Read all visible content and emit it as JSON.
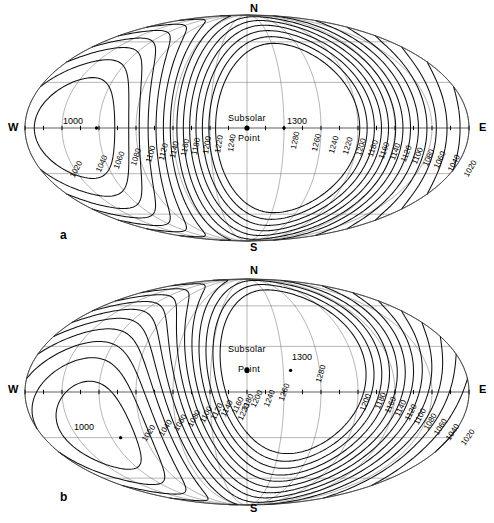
{
  "figure": {
    "kind": "two-panel global contour map",
    "projection": "Mollweide (elliptical equal-area)",
    "panels": [
      {
        "id": "a",
        "caption": "a",
        "cardinal": {
          "north": "N",
          "south": "S",
          "west": "W",
          "east": "E"
        },
        "annotations": [
          {
            "name": "subsolar-point",
            "line1": "Subsolar",
            "line2": "Point"
          },
          {
            "name": "max-value-label",
            "text": "1300"
          },
          {
            "name": "min-value-label",
            "text": "1000"
          }
        ],
        "contour_labels_left": [
          "1020",
          "1040",
          "1060",
          "1080",
          "1100",
          "1120",
          "1140",
          "1160",
          "1180",
          "1200",
          "1220",
          "1240"
        ],
        "contour_labels_right": [
          "1280",
          "1260",
          "1240",
          "1220",
          "1200",
          "1180",
          "1160",
          "1140",
          "1120",
          "1100",
          "1080",
          "1060",
          "1040",
          "1020"
        ]
      },
      {
        "id": "b",
        "caption": "b",
        "cardinal": {
          "north": "N",
          "south": "S",
          "west": "W",
          "east": "E"
        },
        "annotations": [
          {
            "name": "subsolar-point",
            "line1": "Subsolar",
            "line2": "Point"
          },
          {
            "name": "max-value-label",
            "text": "1300"
          },
          {
            "name": "min-value-label",
            "text": "1000"
          }
        ],
        "contour_labels_left": [
          "1020",
          "1040",
          "1060",
          "1080",
          "1100",
          "1120",
          "1140",
          "1160",
          "1180",
          "1200",
          "1220",
          "1240",
          "1260",
          "1280"
        ],
        "contour_labels_right": [
          "1200",
          "1180",
          "1160",
          "1140",
          "1120",
          "1100",
          "1080",
          "1060",
          "1040",
          "1020"
        ]
      }
    ]
  },
  "chart_data": {
    "type": "contour",
    "title": "",
    "xlabel": "",
    "ylabel": "",
    "projection": "Mollweide",
    "grid": true,
    "legend": "none",
    "units": "",
    "contour_interval": 20,
    "contour_levels": [
      1020,
      1040,
      1060,
      1080,
      1100,
      1120,
      1140,
      1160,
      1180,
      1200,
      1220,
      1240,
      1260,
      1280
    ],
    "value_range": [
      1000,
      1300
    ],
    "extrema": [
      {
        "label": "1300",
        "type": "maximum",
        "panel": "a",
        "lon_deg": 30,
        "lat_deg": 0
      },
      {
        "label": "1000",
        "type": "minimum",
        "panel": "a",
        "lon_deg": -120,
        "lat_deg": 0
      },
      {
        "label": "1300",
        "type": "maximum",
        "panel": "b",
        "lon_deg": 33,
        "lat_deg": 12
      },
      {
        "label": "1000",
        "type": "minimum",
        "panel": "b",
        "lon_deg": -112,
        "lat_deg": -25
      }
    ],
    "subsolar_point": [
      {
        "panel": "a",
        "lon_deg": 0,
        "lat_deg": 0
      },
      {
        "panel": "b",
        "lon_deg": 0,
        "lat_deg": 14
      }
    ],
    "graticule": {
      "meridian_step_deg": 30,
      "parallel_step_deg": 30
    },
    "axis_ticks": {
      "equator_ticks_deg": 15
    }
  },
  "panel_a": {
    "caption": "a",
    "N": "N",
    "S": "S",
    "W": "W",
    "E": "E",
    "subsolar_line1": "Subsolar",
    "subsolar_line2": "Point",
    "max_label": "1300",
    "min_label": "1000",
    "labels": [
      {
        "t": "1020",
        "x": 68,
        "y": 175,
        "r": -62
      },
      {
        "t": "1040",
        "x": 94,
        "y": 170,
        "r": -66
      },
      {
        "t": "1060",
        "x": 112,
        "y": 167,
        "r": -70
      },
      {
        "t": "1080",
        "x": 129,
        "y": 164,
        "r": -72
      },
      {
        "t": "1100",
        "x": 144,
        "y": 161,
        "r": -74
      },
      {
        "t": "1120",
        "x": 157,
        "y": 159,
        "r": -76
      },
      {
        "t": "1140",
        "x": 168,
        "y": 157,
        "r": -77
      },
      {
        "t": "1160",
        "x": 179,
        "y": 155,
        "r": -78
      },
      {
        "t": "1180",
        "x": 190,
        "y": 154,
        "r": -79
      },
      {
        "t": "1200",
        "x": 201,
        "y": 153,
        "r": -80
      },
      {
        "t": "1220",
        "x": 213,
        "y": 152,
        "r": -80
      },
      {
        "t": "1240",
        "x": 226,
        "y": 151,
        "r": -81
      },
      {
        "t": "1280",
        "x": 289,
        "y": 148,
        "r": -78
      },
      {
        "t": "1260",
        "x": 310,
        "y": 150,
        "r": -76
      },
      {
        "t": "1240",
        "x": 327,
        "y": 152,
        "r": -74
      },
      {
        "t": "1220",
        "x": 341,
        "y": 153,
        "r": -73
      },
      {
        "t": "1200",
        "x": 354,
        "y": 154,
        "r": -72
      },
      {
        "t": "1180",
        "x": 366,
        "y": 155,
        "r": -71
      },
      {
        "t": "1160",
        "x": 377,
        "y": 157,
        "r": -70
      },
      {
        "t": "1140",
        "x": 388,
        "y": 158,
        "r": -69
      },
      {
        "t": "1120",
        "x": 399,
        "y": 160,
        "r": -68
      },
      {
        "t": "1100",
        "x": 410,
        "y": 162,
        "r": -67
      },
      {
        "t": "1080",
        "x": 421,
        "y": 164,
        "r": -66
      },
      {
        "t": "1060",
        "x": 432,
        "y": 166,
        "r": -65
      },
      {
        "t": "1040",
        "x": 446,
        "y": 169,
        "r": -63
      },
      {
        "t": "1020",
        "x": 462,
        "y": 174,
        "r": -60
      }
    ]
  },
  "panel_b": {
    "caption": "b",
    "N": "N",
    "S": "S",
    "W": "W",
    "E": "E",
    "subsolar_line1": "Subsolar",
    "subsolar_line2": "Point",
    "max_label": "1300",
    "min_label": "1000",
    "labels": [
      {
        "t": "1020",
        "x": 140,
        "y": 438,
        "r": -56
      },
      {
        "t": "1040",
        "x": 157,
        "y": 433,
        "r": -58
      },
      {
        "t": "1060",
        "x": 172,
        "y": 428,
        "r": -60
      },
      {
        "t": "1080",
        "x": 186,
        "y": 424,
        "r": -61
      },
      {
        "t": "1100",
        "x": 198,
        "y": 420,
        "r": -62
      },
      {
        "t": "1120",
        "x": 209,
        "y": 417,
        "r": -63
      },
      {
        "t": "1140",
        "x": 219,
        "y": 414,
        "r": -63
      },
      {
        "t": "1160",
        "x": 230,
        "y": 411,
        "r": -64
      },
      {
        "t": "1180",
        "x": 240,
        "y": 408,
        "r": -64
      },
      {
        "t": "1200",
        "x": 249,
        "y": 405,
        "r": -65
      },
      {
        "t": "1220",
        "x": 236,
        "y": 418,
        "r": -65
      },
      {
        "t": "1240",
        "x": 262,
        "y": 405,
        "r": -68
      },
      {
        "t": "1260",
        "x": 277,
        "y": 399,
        "r": -70
      },
      {
        "t": "1280",
        "x": 314,
        "y": 381,
        "r": -74
      },
      {
        "t": "1200",
        "x": 358,
        "y": 409,
        "r": -68
      },
      {
        "t": "1180",
        "x": 373,
        "y": 407,
        "r": -67
      },
      {
        "t": "1160",
        "x": 383,
        "y": 411,
        "r": -66
      },
      {
        "t": "1140",
        "x": 393,
        "y": 414,
        "r": -65
      },
      {
        "t": "1120",
        "x": 403,
        "y": 418,
        "r": -63
      },
      {
        "t": "1100",
        "x": 412,
        "y": 422,
        "r": -62
      },
      {
        "t": "1080",
        "x": 422,
        "y": 427,
        "r": -60
      },
      {
        "t": "1060",
        "x": 432,
        "y": 432,
        "r": -58
      },
      {
        "t": "1040",
        "x": 444,
        "y": 437,
        "r": -56
      },
      {
        "t": "1020",
        "x": 459,
        "y": 442,
        "r": -54
      }
    ]
  }
}
